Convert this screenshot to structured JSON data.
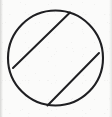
{
  "figure": {
    "title": "Circle with two parallel chords",
    "background_color": "#fbfbfa",
    "stroke_color": "#1f1f22",
    "canvas": {
      "width": 112,
      "height": 117
    },
    "circle": {
      "name": "circle-outline",
      "center_x": 55.5,
      "center_y": 58,
      "radius": 47.5,
      "stroke_width": 2.1
    },
    "chords": [
      {
        "name": "upper-chord",
        "label": "Upper parallel chord",
        "x1": 13,
        "y1": 68,
        "x2": 70,
        "y2": 12.5,
        "stroke_width": 2.0
      },
      {
        "name": "lower-chord",
        "label": "Lower parallel chord",
        "x1": 47.5,
        "y1": 105.5,
        "x2": 99,
        "y2": 53,
        "stroke_width": 2.0
      }
    ]
  }
}
